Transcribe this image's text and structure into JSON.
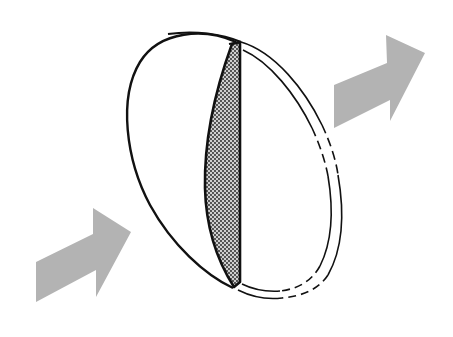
{
  "figure": {
    "title": "Plano-convex lens cross-section with light passing through",
    "subject": "lens",
    "colors": {
      "background": "#ffffff",
      "outline": "#111111",
      "arrow_fill": "#b3b3b3",
      "section_fill": "#cfcfcf",
      "stipple_dot": "#1a1a1a"
    },
    "parts": [
      {
        "name": "incoming-light-arrow",
        "direction": "up-right"
      },
      {
        "name": "lens-front-surface"
      },
      {
        "name": "lens-cross-section",
        "pattern": "stippled"
      },
      {
        "name": "lens-rear-rim",
        "style": "double line, partly dashed"
      },
      {
        "name": "outgoing-light-arrow",
        "direction": "up-right"
      }
    ]
  }
}
